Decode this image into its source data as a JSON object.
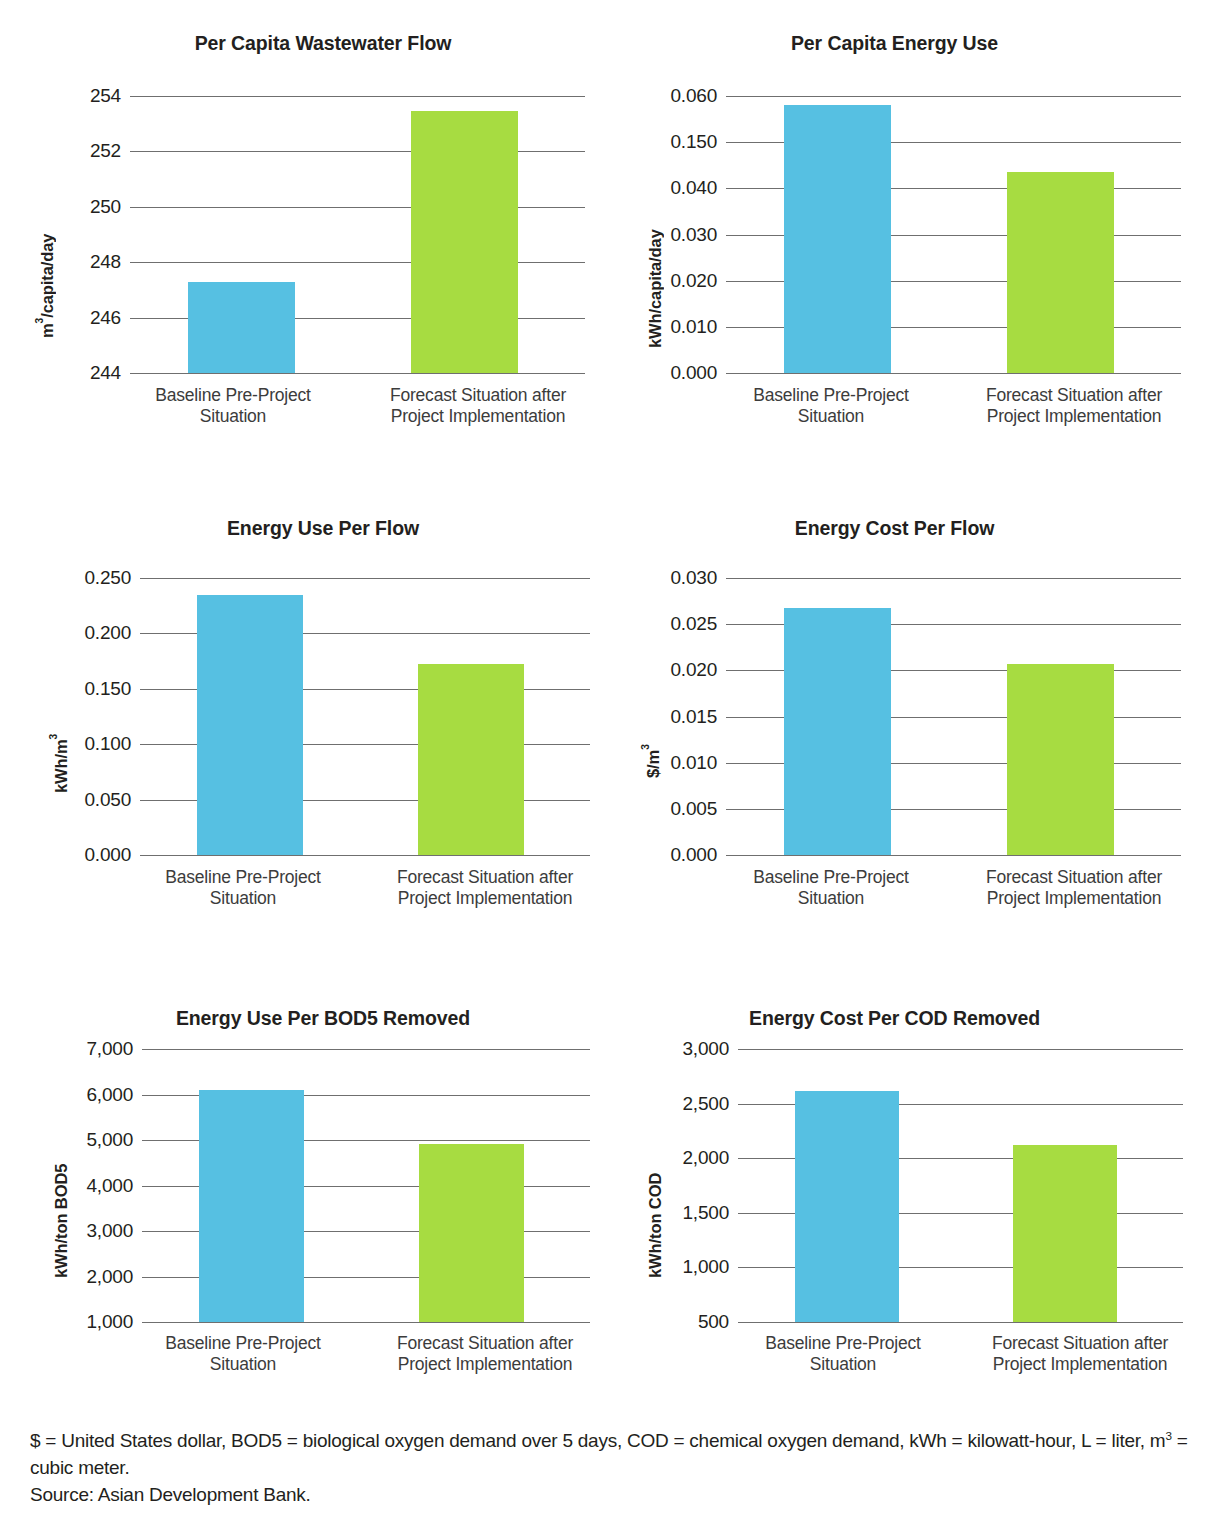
{
  "colors": {
    "baseline_blue": "#56c0e2",
    "forecast_green": "#a7dc41",
    "gridline": "#6f6f6f",
    "text": "#231f20"
  },
  "series_names": {
    "baseline": "Baseline Pre-Project Situation",
    "forecast": "Forecast Situation after Project Implementation"
  },
  "categories": [
    "Baseline Pre-Project\nSituation",
    "Forecast Situation after\nProject Implementation"
  ],
  "xlabels": {
    "baseline_line1": "Baseline Pre-Project",
    "baseline_line2": "Situation",
    "forecast_line1": "Forecast Situation after",
    "forecast_line2": "Project Implementation"
  },
  "footnote": {
    "line1": "$ = United States dollar, BOD5 = biological oxygen demand over 5 days, COD = chemical oxygen demand, kWh = kilowatt-hour, L = liter,",
    "line2_pre": "m",
    "line2_sup": "3",
    "line2_post": " = cubic meter.",
    "source": "Source: Asian Development Bank."
  },
  "chart_data": [
    {
      "id": "per-capita-wastewater-flow",
      "type": "bar",
      "title": "Per Capita Wastewater Flow",
      "xlabel": "",
      "ylabel": "m3/capita/day",
      "ylabel_pre": "m",
      "ylabel_sup": "3",
      "ylabel_post": "/capita/day",
      "categories": [
        "Baseline Pre-Project Situation",
        "Forecast Situation after Project Implementation"
      ],
      "values": [
        247.3,
        253.45
      ],
      "colors": [
        "#56c0e2",
        "#a7dc41"
      ],
      "yticks": [
        "254",
        "252",
        "250",
        "248",
        "246",
        "244"
      ],
      "ytickvalues": [
        254,
        252,
        250,
        248,
        246,
        244
      ],
      "ylim": [
        244,
        254
      ],
      "grid": true,
      "legend": "none"
    },
    {
      "id": "per-capita-energy-use",
      "type": "bar",
      "title": "Per Capita Energy Use",
      "xlabel": "",
      "ylabel": "kWh/capita/day",
      "ylabel_pre": "kWh/capita/day",
      "ylabel_sup": "",
      "ylabel_post": "",
      "categories": [
        "Baseline Pre-Project Situation",
        "Forecast Situation after Project Implementation"
      ],
      "values": [
        0.0581,
        0.0435
      ],
      "colors": [
        "#56c0e2",
        "#a7dc41"
      ],
      "yticks": [
        "0.060",
        "0.150",
        "0.040",
        "0.030",
        "0.020",
        "0.010",
        "0.000"
      ],
      "ytickvalues": [
        0.06,
        0.05,
        0.04,
        0.03,
        0.02,
        0.01,
        0.0
      ],
      "ylim": [
        0.0,
        0.06
      ],
      "grid": true,
      "legend": "none",
      "note": "Tick label '0.150' appears as printed in the source figure at the 0.050 gridline position."
    },
    {
      "id": "energy-use-per-flow",
      "type": "bar",
      "title": "Energy Use Per Flow",
      "xlabel": "",
      "ylabel": "kWh/m3",
      "ylabel_pre": "kWh/m",
      "ylabel_sup": "3",
      "ylabel_post": "",
      "categories": [
        "Baseline Pre-Project Situation",
        "Forecast Situation after Project Implementation"
      ],
      "values": [
        0.235,
        0.172
      ],
      "colors": [
        "#56c0e2",
        "#a7dc41"
      ],
      "yticks": [
        "0.250",
        "0.200",
        "0.150",
        "0.100",
        "0.050",
        "0.000"
      ],
      "ytickvalues": [
        0.25,
        0.2,
        0.15,
        0.1,
        0.05,
        0.0
      ],
      "ylim": [
        0.0,
        0.25
      ],
      "grid": true,
      "legend": "none"
    },
    {
      "id": "energy-cost-per-flow",
      "type": "bar",
      "title": "Energy Cost Per Flow",
      "xlabel": "",
      "ylabel": "$/m3",
      "ylabel_pre": "$/m",
      "ylabel_sup": "3",
      "ylabel_post": "",
      "categories": [
        "Baseline Pre-Project Situation",
        "Forecast Situation after Project Implementation"
      ],
      "values": [
        0.0267,
        0.0207
      ],
      "colors": [
        "#56c0e2",
        "#a7dc41"
      ],
      "yticks": [
        "0.030",
        "0.025",
        "0.020",
        "0.015",
        "0.010",
        "0.005",
        "0.000"
      ],
      "ytickvalues": [
        0.03,
        0.025,
        0.02,
        0.015,
        0.01,
        0.005,
        0.0
      ],
      "ylim": [
        0.0,
        0.03
      ],
      "grid": true,
      "legend": "none"
    },
    {
      "id": "energy-use-per-bod5-removed",
      "type": "bar",
      "title": "Energy Use Per BOD5 Removed",
      "xlabel": "",
      "ylabel": "kWh/ton BOD5",
      "ylabel_pre": "kWh/ton BOD5",
      "ylabel_sup": "",
      "ylabel_post": "",
      "categories": [
        "Baseline Pre-Project Situation",
        "Forecast Situation after Project Implementation"
      ],
      "values": [
        6100,
        4920
      ],
      "colors": [
        "#56c0e2",
        "#a7dc41"
      ],
      "yticks": [
        "7,000",
        "6,000",
        "5,000",
        "4,000",
        "3,000",
        "2,000",
        "1,000"
      ],
      "ytickvalues": [
        7000,
        6000,
        5000,
        4000,
        3000,
        2000,
        1000
      ],
      "ylim": [
        1000,
        7000
      ],
      "grid": true,
      "legend": "none"
    },
    {
      "id": "energy-cost-per-cod-removed",
      "type": "bar",
      "title": "Energy Cost Per COD Removed",
      "xlabel": "",
      "ylabel": "kWh/ton COD",
      "ylabel_pre": "kWh/ton COD",
      "ylabel_sup": "",
      "ylabel_post": "",
      "categories": [
        "Baseline Pre-Project Situation",
        "Forecast Situation after Project Implementation"
      ],
      "values": [
        2620,
        2120
      ],
      "colors": [
        "#56c0e2",
        "#a7dc41"
      ],
      "yticks": [
        "3,000",
        "2,500",
        "2,000",
        "1,500",
        "1,000",
        "500"
      ],
      "ytickvalues": [
        3000,
        2500,
        2000,
        1500,
        1000,
        500
      ],
      "ylim": [
        500,
        3000
      ],
      "grid": true,
      "legend": "none"
    }
  ]
}
